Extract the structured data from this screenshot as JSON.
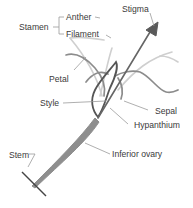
{
  "diagram": {
    "colors": {
      "outline": "#5a5a5a",
      "light": "#c9c9c9",
      "mid": "#8a8a8a",
      "leader": "#9a9a9a",
      "text": "#3a3a3a"
    },
    "labels": {
      "stamen": "Stamen",
      "anther": "Anther",
      "filament": "Filament",
      "stigma": "Stigma",
      "petal": "Petal",
      "style": "Style",
      "sepal": "Sepal",
      "hypanthium": "Hypanthium",
      "stem": "Stem",
      "inferior_ovary": "Inferior ovary"
    }
  }
}
